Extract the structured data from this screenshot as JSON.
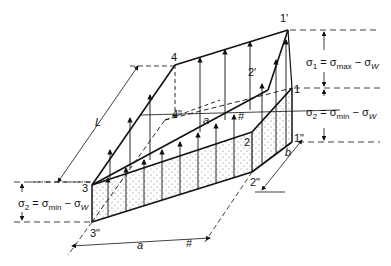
{
  "figure": {
    "type": "isometric stress distribution diagram",
    "colors": {
      "line": "#111111",
      "background": "#ffffff",
      "stipple": "#444444"
    }
  },
  "points": {
    "p1": "1",
    "p1_prime": "1'",
    "p1_dprime": "1\"",
    "p2": "2",
    "p2_prime": "2'",
    "p2_dprime": "2\"",
    "p3": "3",
    "p3_dprime": "3\"",
    "p4": "4",
    "p4_dprime": "4\""
  },
  "dimensions": {
    "length": "L",
    "width_a_bottom": "a",
    "width_a_inner": "a",
    "depth": "b",
    "parallel_mark": "#"
  },
  "equations": {
    "sigma1": {
      "lhs": "σ",
      "lhs_sub": "1",
      "eq": "=",
      "rhs": "σ",
      "rhs_sub": "max",
      "minus": "−",
      "rhs2": "σ",
      "rhs2_sub": "W"
    },
    "sigma2_right": {
      "lhs": "σ",
      "lhs_sub": "2",
      "eq": "=",
      "rhs": "σ",
      "rhs_sub": "min",
      "minus": "−",
      "rhs2": "σ",
      "rhs2_sub": "W"
    },
    "sigma2_left": {
      "lhs": "σ",
      "lhs_sub": "2",
      "eq": "=",
      "rhs": "σ",
      "rhs_sub": "min",
      "minus": "−",
      "rhs2": "σ",
      "rhs2_sub": "W"
    }
  }
}
